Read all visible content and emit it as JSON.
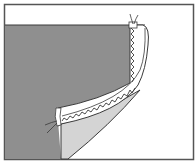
{
  "diagram": {
    "colors": {
      "background": "#ffffff",
      "frame": "#555555",
      "fabric": "#8f8f8f",
      "fabric_underside": "#d4d4d4",
      "facing": "#ffffff",
      "line": "#3a3a3a",
      "stitch": "#3a3a3a"
    },
    "elements": [
      "frame",
      "fabric-main",
      "hem-facing",
      "fabric-underside",
      "zigzag-stitch-vertical",
      "zigzag-stitch-curved",
      "thread-tail-top",
      "thread-tail-left"
    ]
  }
}
